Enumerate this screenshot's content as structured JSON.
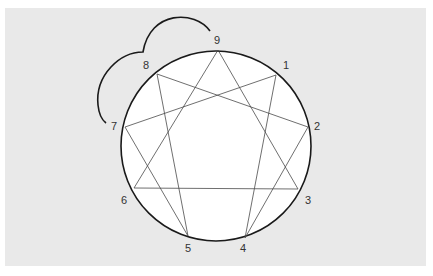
{
  "diagram": {
    "type": "enneagram",
    "background_color": "#e9e9e9",
    "circle": {
      "cx": 216,
      "cy": 146,
      "r": 95,
      "fill": "#ffffff",
      "stroke": "#1a1a1a"
    },
    "points": [
      {
        "id": "9",
        "label": "9",
        "x": 218,
        "y": 50,
        "lx": 217,
        "ly": 44
      },
      {
        "id": "1",
        "label": "1",
        "x": 276,
        "y": 75,
        "lx": 286,
        "ly": 69
      },
      {
        "id": "2",
        "label": "2",
        "x": 308,
        "y": 127,
        "lx": 317,
        "ly": 130
      },
      {
        "id": "3",
        "label": "3",
        "x": 298,
        "y": 189,
        "lx": 308,
        "ly": 204
      },
      {
        "id": "4",
        "label": "4",
        "x": 245,
        "y": 238,
        "lx": 243,
        "ly": 252
      },
      {
        "id": "5",
        "label": "5",
        "x": 188,
        "y": 236,
        "lx": 188,
        "ly": 252
      },
      {
        "id": "6",
        "label": "6",
        "x": 134,
        "y": 188,
        "lx": 124,
        "ly": 204
      },
      {
        "id": "7",
        "label": "7",
        "x": 125,
        "y": 127,
        "lx": 114,
        "ly": 130
      },
      {
        "id": "8",
        "label": "8",
        "x": 157,
        "y": 74,
        "lx": 146,
        "ly": 69
      }
    ],
    "triangle": [
      "9",
      "3",
      "6"
    ],
    "hexad": [
      "1",
      "4",
      "2",
      "8",
      "5",
      "7",
      "1"
    ],
    "wing_arcs": {
      "description": "Two arcs connecting 9-8 and 8-7 outside the circle",
      "path": "M 210 31 C 195 10, 150 10, 143 52 C 120 52, 95 75, 98 105 C 99 115, 102 120, 106 123"
    }
  }
}
